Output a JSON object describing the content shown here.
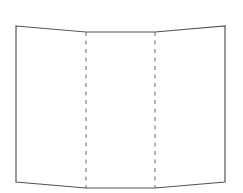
{
  "diagram": {
    "type": "tri-fold paper",
    "panels": 3,
    "colors": {
      "background": "#ffffff",
      "outline": "#555555",
      "fold_line": "#666666"
    },
    "outline_points": [
      [
        16,
        26
      ],
      [
        86,
        32
      ],
      [
        155,
        32
      ],
      [
        225,
        26
      ],
      [
        225,
        182
      ],
      [
        155,
        188
      ],
      [
        86,
        188
      ],
      [
        16,
        182
      ]
    ],
    "fold_lines": [
      {
        "x1": 86,
        "y1": 32,
        "x2": 86,
        "y2": 188,
        "style": "dashed"
      },
      {
        "x1": 155,
        "y1": 32,
        "x2": 155,
        "y2": 188,
        "style": "dashed"
      }
    ]
  }
}
